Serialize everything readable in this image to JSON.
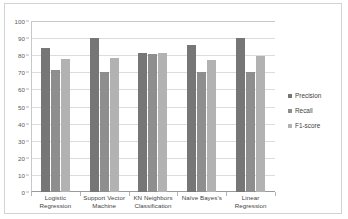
{
  "chart_data": {
    "type": "bar",
    "title": "",
    "xlabel": "",
    "ylabel": "",
    "ylim": [
      0,
      100
    ],
    "yticks": [
      100,
      90,
      80,
      70,
      60,
      50,
      40,
      30,
      20,
      10,
      0
    ],
    "grid": true,
    "legend_position": "right",
    "categories": [
      "Logistic Regression",
      "Support Vector Machine",
      "KN Neighbors Classification",
      "Naïve Bayes's",
      "Linear Regression"
    ],
    "category_lines": [
      [
        "Logistic",
        "Regression"
      ],
      [
        "Support Vector",
        "Machine"
      ],
      [
        "KN Neighbors",
        "Classification"
      ],
      [
        "Naïve Bayes's",
        ""
      ],
      [
        "Linear Regression",
        ""
      ]
    ],
    "series": [
      {
        "name": "Precision",
        "color": "#767676",
        "values": [
          84.5,
          89.8,
          81.5,
          86.0,
          90.0
        ]
      },
      {
        "name": "Recall",
        "color": "#8e8e8e",
        "values": [
          71.5,
          70.3,
          80.5,
          70.0,
          70.0
        ]
      },
      {
        "name": "F1-score",
        "color": "#b2b2b2",
        "values": [
          77.5,
          78.5,
          81.5,
          77.0,
          79.3
        ]
      }
    ]
  },
  "legend": {
    "items": [
      {
        "label": "Precision"
      },
      {
        "label": "Recall"
      },
      {
        "label": "F1-score"
      }
    ]
  },
  "colors": {
    "precision": "#767676",
    "recall": "#8e8e8e",
    "f1_score": "#b2b2b2",
    "gridline": "#dcdcdc",
    "axis": "#9a9a9a",
    "border": "#d3d3d3",
    "background": "#ffffff"
  }
}
